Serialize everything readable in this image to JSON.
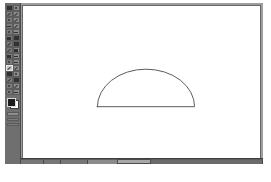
{
  "app": {
    "kind": "raster-image-editor",
    "window_title": "",
    "background_color": "#ffffff",
    "chrome_color": "#6f6f6f",
    "canvas_color": "#ffffff",
    "stroke_color": "#555555"
  },
  "toolbox": {
    "name": "Toolbox",
    "tools": [
      {
        "name": "rectangle-select-tool",
        "icon": "rect-select-icon",
        "selected": false
      },
      {
        "name": "ellipse-select-tool",
        "icon": "ellipse-select-icon",
        "selected": false
      },
      {
        "name": "free-select-tool",
        "icon": "lasso-icon",
        "selected": false
      },
      {
        "name": "fuzzy-select-tool",
        "icon": "magic-wand-icon",
        "selected": false
      },
      {
        "name": "select-by-color-tool",
        "icon": "color-select-icon",
        "selected": false
      },
      {
        "name": "scissors-select-tool",
        "icon": "scissors-icon",
        "selected": false
      },
      {
        "name": "paths-tool",
        "icon": "path-icon",
        "selected": false
      },
      {
        "name": "color-picker-tool",
        "icon": "eyedropper-icon",
        "selected": false
      },
      {
        "name": "zoom-tool",
        "icon": "magnifier-icon",
        "selected": false
      },
      {
        "name": "measure-tool",
        "icon": "ruler-icon",
        "selected": false
      },
      {
        "name": "move-tool",
        "icon": "move-arrows-icon",
        "selected": false
      },
      {
        "name": "crop-tool",
        "icon": "crop-icon",
        "selected": false
      },
      {
        "name": "rotate-tool",
        "icon": "rotate-icon",
        "selected": false
      },
      {
        "name": "scale-tool",
        "icon": "scale-icon",
        "selected": false
      },
      {
        "name": "shear-tool",
        "icon": "shear-icon",
        "selected": false
      },
      {
        "name": "perspective-tool",
        "icon": "perspective-icon",
        "selected": false
      },
      {
        "name": "flip-tool",
        "icon": "flip-icon",
        "selected": false
      },
      {
        "name": "text-tool",
        "icon": "text-a-icon",
        "selected": false
      },
      {
        "name": "bucket-fill-tool",
        "icon": "paint-bucket-icon",
        "selected": false
      },
      {
        "name": "gradient-tool",
        "icon": "gradient-icon",
        "selected": false
      },
      {
        "name": "pencil-tool",
        "icon": "pencil-icon",
        "selected": true
      },
      {
        "name": "paintbrush-tool",
        "icon": "paintbrush-icon",
        "selected": false
      },
      {
        "name": "eraser-tool",
        "icon": "eraser-icon",
        "selected": false
      },
      {
        "name": "airbrush-tool",
        "icon": "airbrush-icon",
        "selected": false
      },
      {
        "name": "ink-tool",
        "icon": "ink-pen-icon",
        "selected": false
      },
      {
        "name": "clone-tool",
        "icon": "clone-stamp-icon",
        "selected": false
      },
      {
        "name": "blur-sharpen-tool",
        "icon": "blur-drop-icon",
        "selected": false
      },
      {
        "name": "smudge-tool",
        "icon": "smudge-finger-icon",
        "selected": false
      },
      {
        "name": "dodge-burn-tool",
        "icon": "dodge-burn-icon",
        "selected": false
      }
    ],
    "color_swatch": {
      "name": "foreground-background-colors",
      "foreground": "#1d1d1d",
      "background": "#ffffff"
    },
    "option_strips": [
      {
        "name": "brush-indicator"
      },
      {
        "name": "pattern-indicator"
      },
      {
        "name": "gradient-indicator"
      }
    ]
  },
  "canvas": {
    "name": "drawing-canvas",
    "background": "#ffffff",
    "border_color": "#666666",
    "drawing": {
      "name": "semicircle-shape",
      "type": "semicircle-outline",
      "description": "Half-disc outline: arc over a horizontal chord",
      "stroke": "#5a5a5a",
      "stroke_width": 1,
      "fill": "none",
      "geometry": {
        "center_x": 141,
        "baseline_y": 104,
        "radius_x": 49,
        "radius_y": 38,
        "start_x": 92,
        "end_x": 190,
        "apex_y": 66
      }
    }
  },
  "statusbar": {
    "name": "status-and-scrollbar",
    "background": "#5e5e5e",
    "scroll_thumb": {
      "name": "horizontal-scroll-thumb"
    },
    "segments": [
      {
        "name": "status-segment-position"
      },
      {
        "name": "status-segment-unit"
      },
      {
        "name": "status-segment-zoom"
      },
      {
        "name": "status-segment-title"
      },
      {
        "name": "status-segment-progress"
      }
    ]
  },
  "caption": {
    "name": "figure-caption",
    "text": "",
    "visible": false
  }
}
